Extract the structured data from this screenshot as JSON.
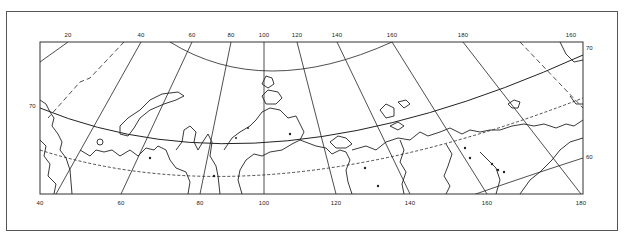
{
  "figure": {
    "type": "map",
    "projection": "polar-conic",
    "region": "Northern Eurasia / Arctic coast"
  },
  "longitude_labels_top": [
    {
      "label": "20",
      "x": 68
    },
    {
      "label": "40",
      "x": 141
    },
    {
      "label": "60",
      "x": 192
    },
    {
      "label": "80",
      "x": 231
    },
    {
      "label": "100",
      "x": 264
    },
    {
      "label": "120",
      "x": 297
    },
    {
      "label": "140",
      "x": 337
    },
    {
      "label": "160",
      "x": 392
    },
    {
      "label": "180",
      "x": 463
    },
    {
      "label": "160",
      "x": 571
    }
  ],
  "longitude_labels_bottom": [
    {
      "label": "40",
      "x": 40
    },
    {
      "label": "60",
      "x": 121
    },
    {
      "label": "80",
      "x": 200
    },
    {
      "label": "100",
      "x": 264
    },
    {
      "label": "120",
      "x": 336
    },
    {
      "label": "140",
      "x": 410
    },
    {
      "label": "160",
      "x": 487
    },
    {
      "label": "180",
      "x": 581
    }
  ],
  "latitude_labels": {
    "left": [
      {
        "label": "70",
        "y": 106
      }
    ],
    "right": [
      {
        "label": "70",
        "y": 48
      },
      {
        "label": "60",
        "y": 157
      }
    ]
  },
  "colors": {
    "line": "#222222",
    "frame": "#555555",
    "background": "#ffffff"
  }
}
